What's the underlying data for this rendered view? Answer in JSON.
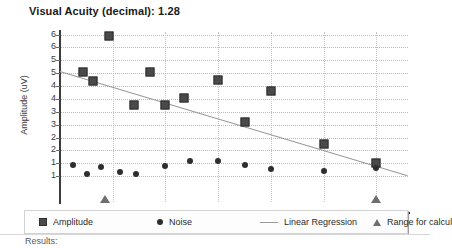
{
  "title": "Visual Acuity (decimal): 1.28",
  "footer": {
    "results_label": "Results:"
  },
  "legend": {
    "position": "bottom",
    "items": [
      {
        "label": "Amplitude",
        "marker": "square-icon"
      },
      {
        "label": "Noise",
        "marker": "circle-icon"
      },
      {
        "label": "Linear Regression",
        "marker": "line-icon"
      },
      {
        "label": "Range for calcul",
        "marker": "triangle-icon"
      }
    ]
  },
  "chart_data": {
    "type": "scatter",
    "title": "Visual Acuity (decimal): 1.28",
    "xlabel": "",
    "ylabel": "Amplitude (uV)",
    "xlim": [
      0,
      33
    ],
    "ylim": [
      0,
      6.6
    ],
    "grid": true,
    "xticks": [
      0,
      5,
      10,
      15,
      20,
      25,
      30
    ],
    "xtick_labels": [
      "0",
      "5",
      "10",
      "15",
      "20",
      "25",
      "30"
    ],
    "yticks": [
      6.5,
      6.0,
      5.5,
      5.0,
      4.5,
      4.0,
      3.5,
      3.0,
      2.5,
      2.0,
      1.5,
      1.0
    ],
    "ytick_labels": [
      "6",
      "6",
      "5",
      "5",
      "4",
      "4",
      "3",
      "3",
      "2",
      "2",
      "1",
      "1"
    ],
    "series": [
      {
        "name": "Amplitude",
        "marker": "square",
        "points": [
          {
            "x": 2.2,
            "y": 5.05
          },
          {
            "x": 3.1,
            "y": 4.7
          },
          {
            "x": 4.6,
            "y": 6.45
          },
          {
            "x": 7.0,
            "y": 3.75
          },
          {
            "x": 8.5,
            "y": 5.05
          },
          {
            "x": 10.0,
            "y": 3.75
          },
          {
            "x": 11.8,
            "y": 4.05
          },
          {
            "x": 15.0,
            "y": 4.75
          },
          {
            "x": 17.5,
            "y": 3.1
          },
          {
            "x": 20.0,
            "y": 4.3
          },
          {
            "x": 25.0,
            "y": 2.25
          },
          {
            "x": 30.0,
            "y": 1.5
          }
        ]
      },
      {
        "name": "Noise",
        "marker": "circle",
        "points": [
          {
            "x": 1.2,
            "y": 1.45
          },
          {
            "x": 2.6,
            "y": 1.1
          },
          {
            "x": 3.9,
            "y": 1.35
          },
          {
            "x": 5.7,
            "y": 1.18
          },
          {
            "x": 7.2,
            "y": 1.1
          },
          {
            "x": 10.0,
            "y": 1.4
          },
          {
            "x": 12.3,
            "y": 1.58
          },
          {
            "x": 15.0,
            "y": 1.6
          },
          {
            "x": 17.5,
            "y": 1.42
          },
          {
            "x": 20.0,
            "y": 1.28
          },
          {
            "x": 25.0,
            "y": 1.2
          },
          {
            "x": 30.0,
            "y": 1.32
          }
        ]
      },
      {
        "name": "Linear Regression",
        "marker": "line",
        "points": [
          {
            "x": 0.0,
            "y": 5.1
          },
          {
            "x": 33.0,
            "y": 1.05
          }
        ]
      },
      {
        "name": "Range for calcul",
        "marker": "triangle",
        "points": [
          {
            "x": 4.3,
            "y": 0.0
          },
          {
            "x": 30.0,
            "y": 0.0
          }
        ]
      }
    ]
  },
  "colors": {
    "amplitude": "#4a4a4a",
    "noise": "#2e2e2e",
    "regression": "#9a9a9a",
    "range_marker": "#6e6e6e",
    "grid": "#b9b9b9",
    "axis": "#2b2b2b",
    "background": "#ffffff"
  }
}
